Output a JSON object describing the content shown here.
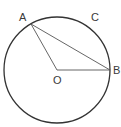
{
  "diagram": {
    "type": "geometry-circle",
    "circle": {
      "center_label": "O",
      "cx": 57,
      "cy": 70,
      "r": 53
    },
    "points": {
      "A": {
        "label": "A",
        "x": 31,
        "y": 24
      },
      "B": {
        "label": "B",
        "x": 110,
        "y": 70
      },
      "C": {
        "label": "C"
      },
      "O": {
        "label": "O",
        "x": 57,
        "y": 70
      }
    },
    "segments": [
      "OA",
      "OB",
      "AB"
    ],
    "colors": {
      "stroke": "#333333",
      "segment": "#555555",
      "label": "#3a3a3a"
    }
  }
}
